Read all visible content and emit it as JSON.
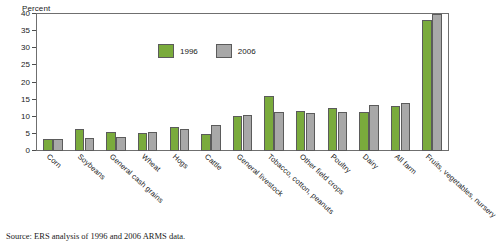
{
  "chart_data": {
    "type": "bar",
    "title": "",
    "xlabel": "",
    "ylabel": "Percent",
    "ylim": [
      0,
      40
    ],
    "yticks": [
      0,
      5,
      10,
      15,
      20,
      25,
      30,
      35,
      40
    ],
    "grid": false,
    "legend_position": "top-center",
    "categories": [
      "Corn",
      "Soybeans",
      "General cash grains",
      "Wheat",
      "Hogs",
      "Cattle",
      "General livestock",
      "Tobacco, cotton, peanuts",
      "Other field crops",
      "Poultry",
      "Dairy",
      "All farm",
      "Fruits, vegetables, nursery"
    ],
    "series": [
      {
        "name": "1996",
        "color": "#7aab3c",
        "values": [
          3.5,
          6.5,
          5.5,
          5.3,
          7.0,
          5.0,
          10.3,
          16.2,
          11.8,
          12.5,
          11.5,
          13.2,
          38.2
        ]
      },
      {
        "name": "2006",
        "color": "#a8a8a8",
        "values": [
          3.5,
          3.8,
          4.2,
          5.5,
          6.5,
          7.6,
          10.5,
          11.5,
          11.0,
          11.5,
          13.3,
          14.0,
          40.0
        ]
      }
    ],
    "source_note": "Source: ERS analysis of 1996 and 2006 ARMS data."
  }
}
